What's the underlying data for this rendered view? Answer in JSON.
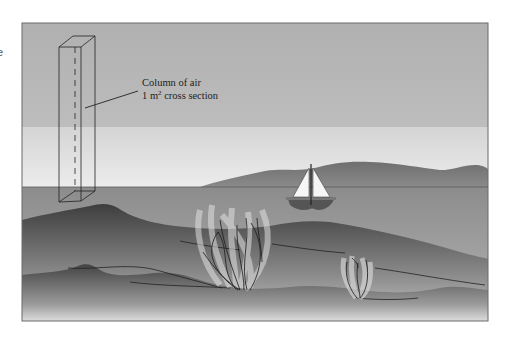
{
  "edge_text": "e",
  "label": {
    "line1": "Column of air",
    "line2_prefix": "1 m",
    "line2_sup": "2",
    "line2_suffix": " cross section"
  },
  "colors": {
    "sky_top": "#b3b3b3",
    "sky_band": "#d6d6d6",
    "sky_horizon": "#ebebeb",
    "far_hills": "#7a7a7a",
    "sea": "#8f8f8f",
    "hill_dark": "#4a4a4a",
    "frame": "#6a6a6a",
    "sail": "#f5f5f5",
    "hull": "#555555"
  }
}
